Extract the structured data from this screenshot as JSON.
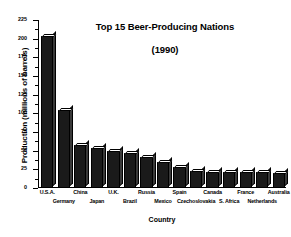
{
  "chart_data": {
    "type": "bar",
    "title": "Top 15 Beer-Producing Nations\n(1990)",
    "title_line1": "Top 15 Beer-Producing Nations",
    "title_line2": "(1990)",
    "xlabel": "Country",
    "ylabel": "Production (millions of barrels)",
    "ylim": [
      0,
      225
    ],
    "ytick_step": 25,
    "yticks": [
      0,
      25,
      50,
      75,
      100,
      125,
      150,
      175,
      200,
      225
    ],
    "ytick_labels": [
      "0",
      "25",
      "50",
      "75",
      "100",
      "125",
      "150",
      "175",
      "200",
      "225"
    ],
    "grid": false,
    "legend": false,
    "bar_style": "3d-black-front-white-top",
    "categories": [
      "U.S.A.",
      "Germany",
      "China",
      "Japan",
      "U.K.",
      "Brazil",
      "Russia",
      "Mexico",
      "Spain",
      "Czechoslovakia",
      "Canada",
      "S. Africa",
      "France",
      "Netherlands",
      "Australia"
    ],
    "values": [
      203,
      104,
      57,
      54,
      49,
      47,
      41,
      35,
      28,
      23,
      22,
      22,
      21,
      21,
      20
    ],
    "colors": {
      "bar_front": "#1a1a1a",
      "bar_top": "#ffffff",
      "bar_side": "#3a3a3a",
      "axis": "#000000",
      "background": "#ffffff"
    }
  }
}
